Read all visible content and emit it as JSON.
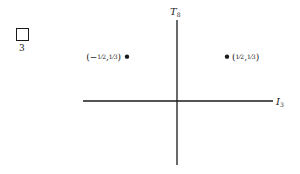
{
  "representation": {
    "box_label": "3",
    "icon": "young-tableau-single-box"
  },
  "axes": {
    "horizontal": {
      "symbol": "I",
      "subscript": "3"
    },
    "vertical": {
      "symbol": "T",
      "subscript": "8"
    }
  },
  "weights": [
    {
      "I3": -0.5,
      "T8": 0.3333,
      "label_open": "(−",
      "n1": "1",
      "d1": "2",
      "sep": ",",
      "n2": "1",
      "d2": "3",
      "label_close": ")",
      "label_side": "left"
    },
    {
      "I3": 0.5,
      "T8": 0.3333,
      "label_open": "(",
      "n1": "1",
      "d1": "2",
      "sep": ",",
      "n2": "1",
      "d2": "3",
      "label_close": ")",
      "label_side": "right"
    },
    {
      "I3": 0,
      "T8": -0.6667,
      "label_open": "(0,−",
      "n1": "",
      "d1": "",
      "sep": "",
      "n2": "2",
      "d2": "3",
      "label_close": ")",
      "label_side": "right"
    }
  ],
  "colors": {
    "ink": "#1a1a1a",
    "background": "#ffffff"
  }
}
